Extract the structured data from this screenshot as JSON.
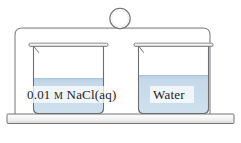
{
  "figure": {
    "type": "chemistry-apparatus-diagram"
  },
  "enclosure": {
    "name": "sealed-glass-enclosure",
    "knob_name": "lid-knob"
  },
  "base": {
    "name": "support-platform"
  },
  "beakers": [
    {
      "id": "left",
      "label_full": "0.01 M NaCl(aq)",
      "label_prefix": "0.01 ",
      "label_molar": "M",
      "label_suffix": " NaCl(aq)",
      "liquid_color": "#c8dced",
      "liquid_level_label": "lower"
    },
    {
      "id": "right",
      "label_full": "Water",
      "label_prefix": "Water",
      "label_molar": "",
      "label_suffix": "",
      "liquid_color": "#c8dced",
      "liquid_level_label": "higher"
    }
  ],
  "colors": {
    "liquid": "#c8dced",
    "liquid_top": "#b9d2e6",
    "glass_stroke": "#6d6e71",
    "frame_stroke": "#808285",
    "plate_fill": "#f1f1f1",
    "background": "#ffffff"
  }
}
